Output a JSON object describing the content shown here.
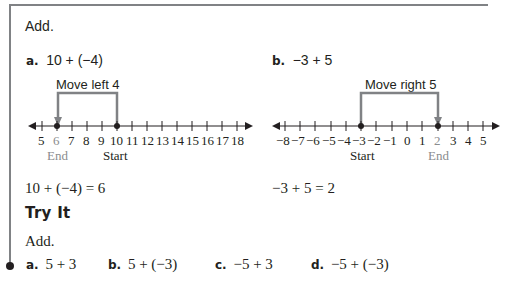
{
  "header": {
    "instruction": "Add."
  },
  "examples": [
    {
      "letter": "a.",
      "expression": "10 + (−4)",
      "move_label": "Move left 4",
      "result": "10 + (−4) = 6",
      "start_label": "Start",
      "end_label": "End"
    },
    {
      "letter": "b.",
      "expression": "−3 + 5",
      "move_label": "Move right 5",
      "result": "−3 + 5 = 2",
      "start_label": "Start",
      "end_label": "End"
    }
  ],
  "number_lines": [
    {
      "ticks": [
        "5",
        "6",
        "7",
        "8",
        "9",
        "10",
        "11",
        "12",
        "13",
        "14",
        "15",
        "16",
        "17",
        "18"
      ],
      "start": 10,
      "end": 6
    },
    {
      "ticks": [
        "−8",
        "−7",
        "−6",
        "−5",
        "−4",
        "−3",
        "−2",
        "−1",
        "0",
        "1",
        "2",
        "3",
        "4",
        "5"
      ],
      "start": -3,
      "end": 2
    }
  ],
  "try_it": {
    "title": "Try It",
    "instruction": "Add.",
    "items": [
      {
        "letter": "a.",
        "expression": "5 + 3"
      },
      {
        "letter": "b.",
        "expression": "5 + (−3)"
      },
      {
        "letter": "c.",
        "expression": "−5 + 3"
      },
      {
        "letter": "d.",
        "expression": "−5 + (−3)"
      }
    ]
  },
  "colors": {
    "frame": "#808285",
    "text": "#231f20",
    "end_label": "#8a8c8e",
    "arrow": "#808285"
  }
}
